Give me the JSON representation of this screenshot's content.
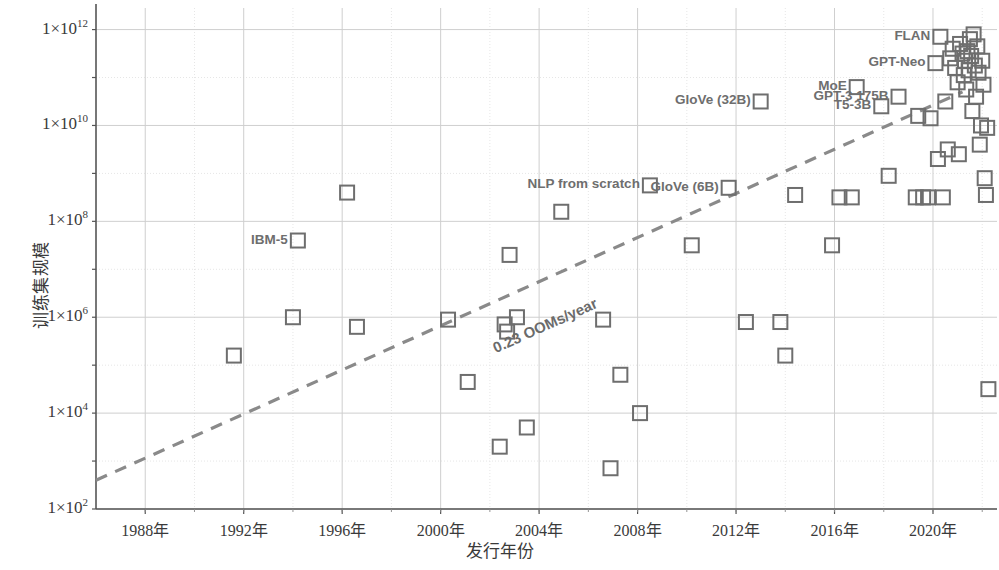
{
  "chart_data": {
    "type": "scatter",
    "title": "",
    "xlabel": "发行年份",
    "ylabel": "训练集规模",
    "xlim": [
      1986.0,
      2022.6
    ],
    "ylim_log10": [
      2,
      12.45
    ],
    "grid": true,
    "legend": "none",
    "marker": "open-square",
    "marker_color": "#6e6e6e",
    "xticks": [
      "1988年",
      "1992年",
      "1996年",
      "2000年",
      "2004年",
      "2008年",
      "2012年",
      "2016年",
      "2020年"
    ],
    "xtick_values": [
      1988,
      1992,
      1996,
      2000,
      2004,
      2008,
      2012,
      2016,
      2020
    ],
    "yticks": [
      "1×10¹²",
      "1×10¹⁰",
      "1×10⁸",
      "1×10⁶",
      "1×10⁴",
      "1×10²"
    ],
    "ytick_values": [
      1000000000000.0,
      10000000000.0,
      100000000.0,
      1000000.0,
      10000.0,
      100.0
    ],
    "trendline": {
      "label": "0.23 OOMs/year",
      "slope_oom_per_year": 0.23,
      "style": "dashed",
      "color": "#8a8a8a",
      "x_start": 1986.0,
      "y_start_log10": 2.6,
      "x_end": 2021.2,
      "y_end_log10": 10.7
    },
    "points": [
      {
        "x": 1991.6,
        "y_log10": 5.2,
        "label": ""
      },
      {
        "x": 1994.0,
        "y_log10": 6.0,
        "label": ""
      },
      {
        "x": 1994.2,
        "y_log10": 7.6,
        "label": "IBM-5"
      },
      {
        "x": 1996.2,
        "y_log10": 8.6,
        "label": ""
      },
      {
        "x": 1996.6,
        "y_log10": 5.8,
        "label": ""
      },
      {
        "x": 2000.3,
        "y_log10": 5.95,
        "label": ""
      },
      {
        "x": 2001.1,
        "y_log10": 4.65,
        "label": ""
      },
      {
        "x": 2002.4,
        "y_log10": 3.3,
        "label": ""
      },
      {
        "x": 2002.6,
        "y_log10": 5.85,
        "label": ""
      },
      {
        "x": 2002.7,
        "y_log10": 5.7,
        "label": ""
      },
      {
        "x": 2002.8,
        "y_log10": 7.3,
        "label": ""
      },
      {
        "x": 2003.1,
        "y_log10": 6.0,
        "label": ""
      },
      {
        "x": 2003.5,
        "y_log10": 3.7,
        "label": ""
      },
      {
        "x": 2004.9,
        "y_log10": 8.2,
        "label": ""
      },
      {
        "x": 2006.6,
        "y_log10": 5.95,
        "label": ""
      },
      {
        "x": 2006.9,
        "y_log10": 2.85,
        "label": ""
      },
      {
        "x": 2007.3,
        "y_log10": 4.8,
        "label": ""
      },
      {
        "x": 2008.1,
        "y_log10": 4.0,
        "label": ""
      },
      {
        "x": 2008.5,
        "y_log10": 8.75,
        "label": "NLP from scratch"
      },
      {
        "x": 2010.2,
        "y_log10": 7.5,
        "label": ""
      },
      {
        "x": 2011.7,
        "y_log10": 8.7,
        "label": "GloVe (6B)"
      },
      {
        "x": 2012.4,
        "y_log10": 5.9,
        "label": ""
      },
      {
        "x": 2013.0,
        "y_log10": 10.5,
        "label": "GloVe (32B)"
      },
      {
        "x": 2013.8,
        "y_log10": 5.9,
        "label": ""
      },
      {
        "x": 2014.0,
        "y_log10": 5.2,
        "label": ""
      },
      {
        "x": 2014.4,
        "y_log10": 8.55,
        "label": ""
      },
      {
        "x": 2015.9,
        "y_log10": 7.5,
        "label": ""
      },
      {
        "x": 2016.2,
        "y_log10": 8.5,
        "label": ""
      },
      {
        "x": 2016.7,
        "y_log10": 8.5,
        "label": ""
      },
      {
        "x": 2016.9,
        "y_log10": 10.8,
        "label": "MoE"
      },
      {
        "x": 2017.9,
        "y_log10": 10.4,
        "label": "T5-3B"
      },
      {
        "x": 2018.2,
        "y_log10": 8.95,
        "label": ""
      },
      {
        "x": 2018.6,
        "y_log10": 10.6,
        "label": "GPT-3 175B"
      },
      {
        "x": 2019.3,
        "y_log10": 8.5,
        "label": ""
      },
      {
        "x": 2019.6,
        "y_log10": 8.5,
        "label": ""
      },
      {
        "x": 2019.8,
        "y_log10": 8.5,
        "label": ""
      },
      {
        "x": 2019.9,
        "y_log10": 10.15,
        "label": ""
      },
      {
        "x": 2020.1,
        "y_log10": 11.3,
        "label": "GPT-Neo"
      },
      {
        "x": 2020.3,
        "y_log10": 11.85,
        "label": "FLAN"
      },
      {
        "x": 2020.4,
        "y_log10": 8.5,
        "label": ""
      },
      {
        "x": 2020.5,
        "y_log10": 10.5,
        "label": ""
      },
      {
        "x": 2020.6,
        "y_log10": 9.5,
        "label": ""
      },
      {
        "x": 2020.7,
        "y_log10": 11.4,
        "label": ""
      },
      {
        "x": 2020.8,
        "y_log10": 11.6,
        "label": ""
      },
      {
        "x": 2020.9,
        "y_log10": 11.2,
        "label": ""
      },
      {
        "x": 2021.0,
        "y_log10": 10.9,
        "label": ""
      },
      {
        "x": 2021.1,
        "y_log10": 11.7,
        "label": ""
      },
      {
        "x": 2021.2,
        "y_log10": 11.5,
        "label": ""
      },
      {
        "x": 2021.25,
        "y_log10": 11.05,
        "label": ""
      },
      {
        "x": 2021.3,
        "y_log10": 11.35,
        "label": ""
      },
      {
        "x": 2021.35,
        "y_log10": 10.75,
        "label": ""
      },
      {
        "x": 2021.4,
        "y_log10": 11.55,
        "label": ""
      },
      {
        "x": 2021.45,
        "y_log10": 11.15,
        "label": ""
      },
      {
        "x": 2021.5,
        "y_log10": 11.8,
        "label": ""
      },
      {
        "x": 2021.55,
        "y_log10": 11.45,
        "label": ""
      },
      {
        "x": 2021.6,
        "y_log10": 10.3,
        "label": ""
      },
      {
        "x": 2021.65,
        "y_log10": 11.9,
        "label": ""
      },
      {
        "x": 2021.7,
        "y_log10": 11.25,
        "label": ""
      },
      {
        "x": 2021.75,
        "y_log10": 10.6,
        "label": ""
      },
      {
        "x": 2021.8,
        "y_log10": 11.65,
        "label": ""
      },
      {
        "x": 2021.85,
        "y_log10": 11.1,
        "label": ""
      },
      {
        "x": 2021.9,
        "y_log10": 9.6,
        "label": ""
      },
      {
        "x": 2021.95,
        "y_log10": 10.0,
        "label": ""
      },
      {
        "x": 2022.0,
        "y_log10": 11.35,
        "label": ""
      },
      {
        "x": 2022.05,
        "y_log10": 10.85,
        "label": ""
      },
      {
        "x": 2022.1,
        "y_log10": 8.9,
        "label": ""
      },
      {
        "x": 2022.15,
        "y_log10": 8.55,
        "label": ""
      },
      {
        "x": 2022.2,
        "y_log10": 9.95,
        "label": ""
      },
      {
        "x": 2022.25,
        "y_log10": 4.5,
        "label": ""
      },
      {
        "x": 2020.2,
        "y_log10": 9.3,
        "label": ""
      },
      {
        "x": 2019.4,
        "y_log10": 10.2,
        "label": ""
      },
      {
        "x": 2021.05,
        "y_log10": 9.4,
        "label": ""
      }
    ],
    "annotations": [
      {
        "text": "IBM-5",
        "anchor_x": 1994.2,
        "anchor_y_log10": 7.6
      },
      {
        "text": "NLP from scratch",
        "anchor_x": 2008.5,
        "anchor_y_log10": 8.75
      },
      {
        "text": "GloVe (6B)",
        "anchor_x": 2011.7,
        "anchor_y_log10": 8.7
      },
      {
        "text": "GloVe (32B)",
        "anchor_x": 2013.0,
        "anchor_y_log10": 10.5
      },
      {
        "text": "MoE",
        "anchor_x": 2016.9,
        "anchor_y_log10": 10.8
      },
      {
        "text": "T5-3B",
        "anchor_x": 2017.9,
        "anchor_y_log10": 10.4
      },
      {
        "text": "GPT-3 175B",
        "anchor_x": 2018.6,
        "anchor_y_log10": 10.6
      },
      {
        "text": "GPT-Neo",
        "anchor_x": 2020.1,
        "anchor_y_log10": 11.3
      },
      {
        "text": "FLAN",
        "anchor_x": 2020.3,
        "anchor_y_log10": 11.85
      }
    ],
    "colors": {
      "marker": "#6e6e6e",
      "grid": "#d8d8d8",
      "axis": "#555555",
      "trend": "#8a8a8a",
      "text": "#3a3a3a",
      "label_text": "#6e6e6e",
      "background": "#ffffff"
    }
  }
}
